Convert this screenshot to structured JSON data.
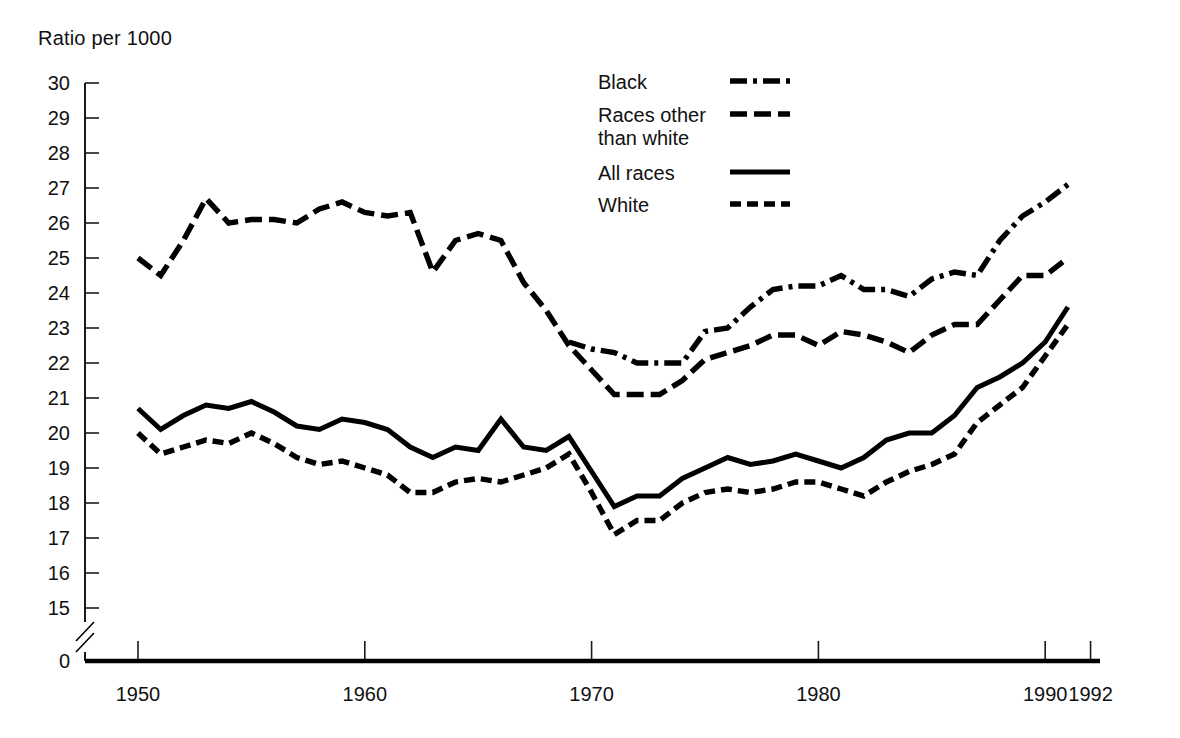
{
  "chart_data": {
    "type": "line",
    "title": "",
    "ylabel": "Ratio per 1000",
    "xlabel": "",
    "ylim": [
      15,
      30
    ],
    "yaxis_break_to_zero": true,
    "ytick_labels": [
      "30",
      "29",
      "28",
      "27",
      "26",
      "25",
      "24",
      "23",
      "22",
      "21",
      "20",
      "19",
      "18",
      "17",
      "16",
      "15",
      "0"
    ],
    "yticks": [
      30,
      29,
      28,
      27,
      26,
      25,
      24,
      23,
      22,
      21,
      20,
      19,
      18,
      17,
      16,
      15,
      0
    ],
    "xlim": [
      1950,
      1992
    ],
    "xtick_labels": [
      "1950",
      "1960",
      "1970",
      "1980",
      "1990",
      "1992"
    ],
    "xticks": [
      1950,
      1960,
      1970,
      1980,
      1990,
      1992
    ],
    "grid": false,
    "legend_position": "top-center",
    "legend": [
      {
        "name": "Black",
        "dash": "dash-dot"
      },
      {
        "name": "Races other than white",
        "dash": "dash"
      },
      {
        "name": "All races",
        "dash": "solid"
      },
      {
        "name": "White",
        "dash": "dot-dash"
      }
    ],
    "series": [
      {
        "name": "Black",
        "dash": "dash-dot",
        "x": [
          1969,
          1970,
          1971,
          1972,
          1973,
          1974,
          1975,
          1976,
          1977,
          1978,
          1979,
          1980,
          1981,
          1982,
          1983,
          1984,
          1985,
          1986,
          1987,
          1988,
          1989,
          1990,
          1991
        ],
        "values": [
          22.6,
          22.4,
          22.3,
          22.0,
          22.0,
          22.0,
          22.9,
          23.0,
          23.6,
          24.1,
          24.2,
          24.2,
          24.5,
          24.1,
          24.1,
          23.9,
          24.4,
          24.6,
          24.5,
          25.5,
          26.2,
          26.6,
          27.1
        ]
      },
      {
        "name": "Races other than white",
        "dash": "dash",
        "x": [
          1950,
          1951,
          1952,
          1953,
          1954,
          1955,
          1956,
          1957,
          1958,
          1959,
          1960,
          1961,
          1962,
          1963,
          1964,
          1965,
          1966,
          1967,
          1968,
          1969,
          1970,
          1971,
          1972,
          1973,
          1974,
          1975,
          1976,
          1977,
          1978,
          1979,
          1980,
          1981,
          1982,
          1983,
          1984,
          1985,
          1986,
          1987,
          1988,
          1989,
          1990,
          1991
        ],
        "values": [
          25.0,
          24.5,
          25.5,
          26.7,
          26.0,
          26.1,
          26.1,
          26.0,
          26.4,
          26.6,
          26.3,
          26.2,
          26.3,
          24.6,
          25.5,
          25.7,
          25.5,
          24.3,
          23.5,
          22.5,
          21.8,
          21.1,
          21.1,
          21.1,
          21.5,
          22.1,
          22.3,
          22.5,
          22.8,
          22.8,
          22.5,
          22.9,
          22.8,
          22.6,
          22.3,
          22.8,
          23.1,
          23.1,
          23.8,
          24.5,
          24.5,
          25.0
        ]
      },
      {
        "name": "All races",
        "dash": "solid",
        "x": [
          1950,
          1951,
          1952,
          1953,
          1954,
          1955,
          1956,
          1957,
          1958,
          1959,
          1960,
          1961,
          1962,
          1963,
          1964,
          1965,
          1966,
          1967,
          1968,
          1969,
          1970,
          1971,
          1972,
          1973,
          1974,
          1975,
          1976,
          1977,
          1978,
          1979,
          1980,
          1981,
          1982,
          1983,
          1984,
          1985,
          1986,
          1987,
          1988,
          1989,
          1990,
          1991
        ],
        "values": [
          20.7,
          20.1,
          20.5,
          20.8,
          20.7,
          20.9,
          20.6,
          20.2,
          20.1,
          20.4,
          20.3,
          20.1,
          19.6,
          19.3,
          19.6,
          19.5,
          20.4,
          19.6,
          19.5,
          19.9,
          18.9,
          17.9,
          18.2,
          18.2,
          18.7,
          19.0,
          19.3,
          19.1,
          19.2,
          19.4,
          19.2,
          19.0,
          19.3,
          19.8,
          20.0,
          20.0,
          20.5,
          21.3,
          21.6,
          22.0,
          22.6,
          23.6
        ]
      },
      {
        "name": "White",
        "dash": "dot-dash",
        "x": [
          1950,
          1951,
          1952,
          1953,
          1954,
          1955,
          1956,
          1957,
          1958,
          1959,
          1960,
          1961,
          1962,
          1963,
          1964,
          1965,
          1966,
          1967,
          1968,
          1969,
          1970,
          1971,
          1972,
          1973,
          1974,
          1975,
          1976,
          1977,
          1978,
          1979,
          1980,
          1981,
          1982,
          1983,
          1984,
          1985,
          1986,
          1987,
          1988,
          1989,
          1990,
          1991
        ],
        "values": [
          20.0,
          19.4,
          19.6,
          19.8,
          19.7,
          20.0,
          19.7,
          19.3,
          19.1,
          19.2,
          19.0,
          18.8,
          18.3,
          18.3,
          18.6,
          18.7,
          18.6,
          18.8,
          19.0,
          19.4,
          18.3,
          17.1,
          17.5,
          17.5,
          18.0,
          18.3,
          18.4,
          18.3,
          18.4,
          18.6,
          18.6,
          18.4,
          18.2,
          18.6,
          18.9,
          19.1,
          19.4,
          20.3,
          20.8,
          21.3,
          22.2,
          23.1
        ]
      }
    ]
  },
  "legend": {
    "items": [
      {
        "label": "Black"
      },
      {
        "label": "Races other"
      },
      {
        "label": "than white"
      },
      {
        "label": "All races"
      },
      {
        "label": "White"
      }
    ]
  },
  "colors": {
    "ink": "#000000",
    "background": "#ffffff"
  }
}
